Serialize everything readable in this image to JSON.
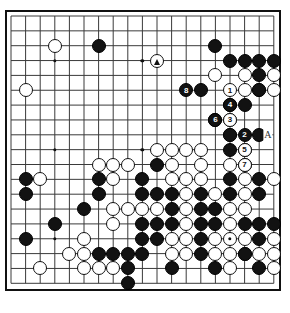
{
  "diagram": {
    "kind": "go-board-diagram",
    "board_size": 19,
    "caption": "",
    "colors": {
      "black_stone": "#121212",
      "white_stone": "#ffffff",
      "grid_line": "#3a3a3a",
      "border": "#111111",
      "background": "#ffffff"
    },
    "geometry": {
      "origin_x": 11.0,
      "origin_y": 16.0,
      "step_x": 14.6,
      "step_y": 14.85,
      "stone_diameter": 14.0
    },
    "star_points": [
      [
        3,
        3
      ],
      [
        9,
        3
      ],
      [
        15,
        3
      ],
      [
        3,
        9
      ],
      [
        9,
        9
      ],
      [
        15,
        9
      ],
      [
        3,
        15
      ],
      [
        9,
        15
      ],
      [
        15,
        15
      ]
    ],
    "black_stones": [
      [
        6,
        2
      ],
      [
        14,
        2
      ],
      [
        15,
        3
      ],
      [
        17,
        3
      ],
      [
        18,
        3
      ],
      [
        16,
        3
      ],
      [
        17,
        4
      ],
      [
        13,
        5
      ],
      [
        17,
        5
      ],
      [
        15,
        6
      ],
      [
        16,
        6
      ],
      [
        14,
        7
      ],
      [
        15,
        8
      ],
      [
        17,
        8
      ],
      [
        16,
        9
      ],
      [
        15,
        9
      ],
      [
        10,
        10
      ],
      [
        16,
        10
      ],
      [
        1,
        11
      ],
      [
        6,
        11
      ],
      [
        9,
        11
      ],
      [
        15,
        11
      ],
      [
        17,
        11
      ],
      [
        1,
        12
      ],
      [
        6,
        12
      ],
      [
        9,
        12
      ],
      [
        10,
        12
      ],
      [
        11,
        12
      ],
      [
        13,
        12
      ],
      [
        15,
        12
      ],
      [
        17,
        12
      ],
      [
        5,
        13
      ],
      [
        11,
        13
      ],
      [
        13,
        13
      ],
      [
        14,
        13
      ],
      [
        3,
        14
      ],
      [
        9,
        14
      ],
      [
        10,
        14
      ],
      [
        11,
        14
      ],
      [
        13,
        14
      ],
      [
        14,
        14
      ],
      [
        16,
        14
      ],
      [
        17,
        14
      ],
      [
        18,
        14
      ],
      [
        1,
        15
      ],
      [
        9,
        15
      ],
      [
        10,
        15
      ],
      [
        13,
        15
      ],
      [
        17,
        15
      ],
      [
        6,
        16
      ],
      [
        7,
        16
      ],
      [
        8,
        16
      ],
      [
        9,
        16
      ],
      [
        13,
        16
      ],
      [
        16,
        16
      ],
      [
        8,
        17
      ],
      [
        11,
        17
      ],
      [
        14,
        17
      ],
      [
        17,
        17
      ],
      [
        8,
        18
      ]
    ],
    "white_stones": [
      [
        3,
        2
      ],
      [
        1,
        5
      ],
      [
        14,
        4
      ],
      [
        16,
        4
      ],
      [
        18,
        4
      ],
      [
        16,
        5
      ],
      [
        17,
        5
      ],
      [
        18,
        5
      ],
      [
        15,
        7
      ],
      [
        15,
        8
      ],
      [
        10,
        9
      ],
      [
        11,
        9
      ],
      [
        12,
        9
      ],
      [
        13,
        9
      ],
      [
        6,
        10
      ],
      [
        7,
        10
      ],
      [
        8,
        10
      ],
      [
        11,
        10
      ],
      [
        13,
        10
      ],
      [
        15,
        10
      ],
      [
        2,
        11
      ],
      [
        11,
        11
      ],
      [
        12,
        11
      ],
      [
        13,
        11
      ],
      [
        16,
        11
      ],
      [
        18,
        11
      ],
      [
        7,
        11
      ],
      [
        12,
        12
      ],
      [
        14,
        12
      ],
      [
        16,
        12
      ],
      [
        7,
        13
      ],
      [
        8,
        13
      ],
      [
        9,
        13
      ],
      [
        10,
        13
      ],
      [
        12,
        13
      ],
      [
        15,
        13
      ],
      [
        16,
        13
      ],
      [
        7,
        14
      ],
      [
        12,
        14
      ],
      [
        15,
        14
      ],
      [
        5,
        15
      ],
      [
        11,
        15
      ],
      [
        12,
        15
      ],
      [
        14,
        15
      ],
      [
        15,
        15
      ],
      [
        16,
        15
      ],
      [
        18,
        15
      ],
      [
        4,
        16
      ],
      [
        5,
        16
      ],
      [
        11,
        16
      ],
      [
        12,
        16
      ],
      [
        14,
        16
      ],
      [
        15,
        16
      ],
      [
        16,
        16
      ],
      [
        17,
        16
      ],
      [
        18,
        16
      ],
      [
        2,
        17
      ],
      [
        5,
        17
      ],
      [
        6,
        17
      ],
      [
        7,
        17
      ],
      [
        15,
        17
      ],
      [
        18,
        17
      ]
    ],
    "move_stones": [
      {
        "number": "1",
        "col": 15,
        "row": 5,
        "color": "white"
      },
      {
        "number": "2",
        "col": 16,
        "row": 8,
        "color": "black"
      },
      {
        "number": "3",
        "col": 15,
        "row": 7,
        "color": "white"
      },
      {
        "number": "4",
        "col": 15,
        "row": 6,
        "color": "black"
      },
      {
        "number": "5",
        "col": 16,
        "row": 9,
        "color": "white"
      },
      {
        "number": "6",
        "col": 14,
        "row": 7,
        "color": "black"
      },
      {
        "number": "7",
        "col": 16,
        "row": 10,
        "color": "white"
      },
      {
        "number": "8",
        "col": 12,
        "row": 5,
        "color": "black"
      }
    ],
    "marked_stones": [
      {
        "marker": "triangle",
        "col": 10,
        "row": 3,
        "color": "white"
      }
    ],
    "board_letters": [
      {
        "text": "A",
        "col": 17.6,
        "row": 8
      }
    ]
  }
}
